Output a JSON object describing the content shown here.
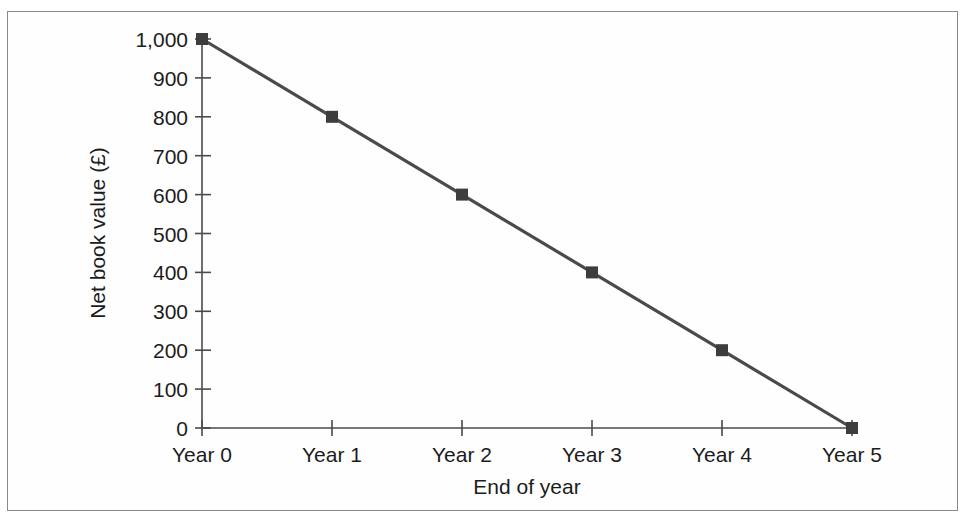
{
  "figure": {
    "background_color": "#ffffff",
    "frame_color": "#8a8a8a",
    "line_color": "#4a4a4a",
    "marker_color": "#3d3d3d",
    "text_color": "#1c1c1c"
  },
  "chart_data": {
    "type": "line",
    "title": "",
    "xlabel": "End of year",
    "ylabel": "Net book value (£)",
    "categories": [
      "Year 0",
      "Year 1",
      "Year 2",
      "Year 3",
      "Year 4",
      "Year 5"
    ],
    "x": [
      0,
      1,
      2,
      3,
      4,
      5
    ],
    "values": [
      1000,
      800,
      600,
      400,
      200,
      0
    ],
    "series": [
      {
        "name": "Net book value",
        "values": [
          1000,
          800,
          600,
          400,
          200,
          0
        ]
      }
    ],
    "ylim": [
      0,
      1000
    ],
    "ytick_values": [
      0,
      100,
      200,
      300,
      400,
      500,
      600,
      700,
      800,
      900,
      1000
    ],
    "ytick_labels": [
      "0",
      "100",
      "200",
      "300",
      "400",
      "500",
      "600",
      "700",
      "800",
      "900",
      "1,000"
    ],
    "xtick_labels": [
      "Year 0",
      "Year 1",
      "Year 2",
      "Year 3",
      "Year 4",
      "Year 5"
    ],
    "grid": false,
    "legend": false,
    "legend_position": "none",
    "marker": "square",
    "annotations": []
  }
}
